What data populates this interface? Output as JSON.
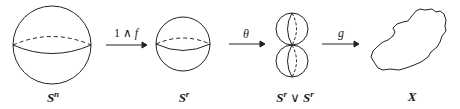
{
  "diagram": {
    "stroke_color": "#222222",
    "background": "#ffffff",
    "nodes": [
      {
        "id": "sn",
        "label_base": "S",
        "label_sup": "n",
        "shape": "sphere-large"
      },
      {
        "id": "sr",
        "label_base": "S",
        "label_sup": "r",
        "shape": "sphere-small"
      },
      {
        "id": "wedge",
        "label_left_base": "S",
        "label_left_sup": "r",
        "label_op": "∨",
        "label_right_base": "S",
        "label_right_sup": "r",
        "shape": "wedge-of-spheres"
      },
      {
        "id": "x",
        "label": "X",
        "shape": "blob"
      }
    ],
    "arrows": [
      {
        "from": "sn",
        "to": "sr",
        "label_num": "1",
        "label_op": "∧",
        "label_fn": "f"
      },
      {
        "from": "sr",
        "to": "wedge",
        "label": "θ"
      },
      {
        "from": "wedge",
        "to": "x",
        "label": "g"
      }
    ]
  }
}
